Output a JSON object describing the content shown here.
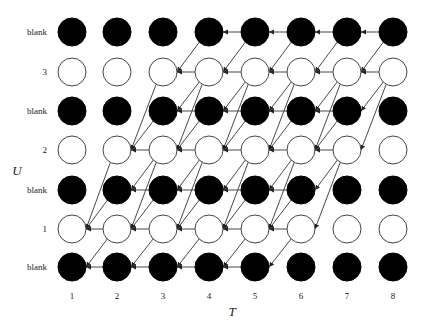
{
  "diagram": {
    "x_axis_label": "T",
    "y_axis_label": "U",
    "columns": [
      "1",
      "2",
      "3",
      "4",
      "5",
      "6",
      "7",
      "8"
    ],
    "rows_top_to_bottom": [
      {
        "label": "blank",
        "type": "blank"
      },
      {
        "label": "3",
        "type": "label"
      },
      {
        "label": "blank",
        "type": "blank"
      },
      {
        "label": "2",
        "type": "label"
      },
      {
        "label": "blank",
        "type": "blank"
      },
      {
        "label": "1",
        "type": "label"
      },
      {
        "label": "blank",
        "type": "blank"
      }
    ],
    "forward_max_row_from_bottom": [
      1,
      3,
      5,
      6,
      6,
      6,
      6,
      6
    ],
    "backward_min_row_from_bottom": [
      0,
      0,
      0,
      0,
      0,
      1,
      3,
      5
    ],
    "edge_direction": "from time t+1 to time t (arrowheads point left)",
    "colors": {
      "blank_node": "#000000",
      "label_node_fill": "#ffffff",
      "label_node_stroke": "#444444",
      "edge": "#333333",
      "text": "#222222"
    }
  },
  "layout": {
    "col_x": [
      72,
      117,
      163,
      209,
      255,
      301,
      347,
      393
    ],
    "row_y": [
      32,
      72,
      111,
      150,
      190,
      229,
      267
    ],
    "node_radius": 14,
    "row_label_x": 47,
    "tick_label_y": 299,
    "x_axis_label_pos": [
      232,
      316
    ],
    "y_axis_label_pos": [
      17,
      175
    ]
  }
}
